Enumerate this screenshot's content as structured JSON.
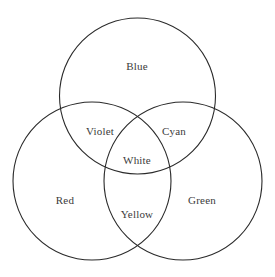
{
  "figure": {
    "name": "additive-color-venn-diagram",
    "width": 275,
    "height": 277,
    "background_color": "#ffffff",
    "stroke_color": "#2a2a2a",
    "stroke_width": 1.1,
    "label_color": "#3b3b3b",
    "label_font_size": 11
  },
  "chart_data": {
    "type": "diagram",
    "diagram_kind": "venn",
    "set_count": 3,
    "title": "",
    "grid": false,
    "legend": "none",
    "sets": [
      {
        "id": "blue",
        "label": "Blue",
        "cx": 137.5,
        "cy": 96,
        "r": 78
      },
      {
        "id": "red",
        "label": "Red",
        "cx": 92,
        "cy": 181,
        "r": 79
      },
      {
        "id": "green",
        "label": "Green",
        "cx": 183,
        "cy": 181,
        "r": 79
      }
    ],
    "regions": [
      {
        "id": "blue-only",
        "label": "Blue",
        "members": [
          "blue"
        ],
        "x": 137,
        "y": 66
      },
      {
        "id": "red-only",
        "label": "Red",
        "members": [
          "red"
        ],
        "x": 65,
        "y": 200
      },
      {
        "id": "green-only",
        "label": "Green",
        "members": [
          "green"
        ],
        "x": 202,
        "y": 200
      },
      {
        "id": "blue-red",
        "label": "Violet",
        "members": [
          "blue",
          "red"
        ],
        "x": 100,
        "y": 131
      },
      {
        "id": "blue-green",
        "label": "Cyan",
        "members": [
          "blue",
          "green"
        ],
        "x": 174,
        "y": 131
      },
      {
        "id": "red-green",
        "label": "Yellow",
        "members": [
          "red",
          "green"
        ],
        "x": 137,
        "y": 214
      },
      {
        "id": "blue-red-green",
        "label": "White",
        "members": [
          "blue",
          "red",
          "green"
        ],
        "x": 137,
        "y": 160
      }
    ]
  }
}
